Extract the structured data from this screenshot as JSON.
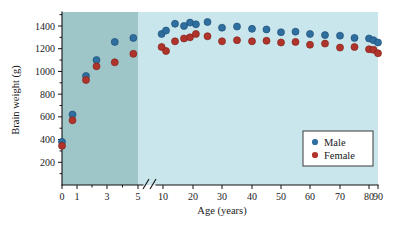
{
  "chart_data": {
    "type": "scatter",
    "title": "",
    "xlabel": "Age (years)",
    "ylabel": "Brain weight (g)",
    "xticks": [
      "0",
      "1",
      "3",
      "5",
      "10",
      "20",
      "30",
      "40",
      "50",
      "60",
      "70",
      "80",
      "90"
    ],
    "yticks": [
      "200",
      "400",
      "600",
      "800",
      "1000",
      "1200",
      "1400"
    ],
    "ylim": [
      0,
      1500
    ],
    "grid": false,
    "axis_break": {
      "between": [
        5,
        10
      ],
      "symbol": "//"
    },
    "legend": {
      "position": "bottom-right",
      "entries": [
        {
          "name": "Male",
          "color": "#2f6f9f"
        },
        {
          "name": "Female",
          "color": "#b0342c"
        }
      ]
    },
    "background_bands": [
      {
        "label": "early-childhood-band",
        "x_from": 0,
        "x_to": 5,
        "color": "#9ec6c8"
      },
      {
        "label": "adult-band",
        "x_from": 5,
        "x_to": 90,
        "color": "#c9e6ec"
      }
    ],
    "series": [
      {
        "name": "Male",
        "color": "#2f6f9f",
        "points": [
          {
            "x": 0,
            "y": 380
          },
          {
            "x": 0.7,
            "y": 620
          },
          {
            "x": 1.6,
            "y": 960
          },
          {
            "x": 2.3,
            "y": 1100
          },
          {
            "x": 3.5,
            "y": 1260
          },
          {
            "x": 4.7,
            "y": 1295
          },
          {
            "x": 9,
            "y": 1330
          },
          {
            "x": 11,
            "y": 1360
          },
          {
            "x": 14,
            "y": 1420
          },
          {
            "x": 17,
            "y": 1400
          },
          {
            "x": 19,
            "y": 1430
          },
          {
            "x": 21,
            "y": 1415
          },
          {
            "x": 25,
            "y": 1435
          },
          {
            "x": 30,
            "y": 1385
          },
          {
            "x": 35,
            "y": 1395
          },
          {
            "x": 40,
            "y": 1375
          },
          {
            "x": 45,
            "y": 1370
          },
          {
            "x": 50,
            "y": 1345
          },
          {
            "x": 55,
            "y": 1350
          },
          {
            "x": 60,
            "y": 1330
          },
          {
            "x": 65,
            "y": 1320
          },
          {
            "x": 70,
            "y": 1315
          },
          {
            "x": 75,
            "y": 1295
          },
          {
            "x": 80,
            "y": 1290
          },
          {
            "x": 85,
            "y": 1275
          },
          {
            "x": 90,
            "y": 1255
          }
        ]
      },
      {
        "name": "Female",
        "color": "#b0342c",
        "points": [
          {
            "x": 0,
            "y": 345
          },
          {
            "x": 0.7,
            "y": 570
          },
          {
            "x": 1.6,
            "y": 925
          },
          {
            "x": 2.3,
            "y": 1045
          },
          {
            "x": 3.5,
            "y": 1080
          },
          {
            "x": 4.7,
            "y": 1155
          },
          {
            "x": 9,
            "y": 1215
          },
          {
            "x": 11,
            "y": 1180
          },
          {
            "x": 14,
            "y": 1265
          },
          {
            "x": 17,
            "y": 1290
          },
          {
            "x": 19,
            "y": 1300
          },
          {
            "x": 21,
            "y": 1330
          },
          {
            "x": 25,
            "y": 1310
          },
          {
            "x": 30,
            "y": 1265
          },
          {
            "x": 35,
            "y": 1275
          },
          {
            "x": 40,
            "y": 1265
          },
          {
            "x": 45,
            "y": 1270
          },
          {
            "x": 50,
            "y": 1255
          },
          {
            "x": 55,
            "y": 1260
          },
          {
            "x": 60,
            "y": 1235
          },
          {
            "x": 65,
            "y": 1245
          },
          {
            "x": 70,
            "y": 1210
          },
          {
            "x": 75,
            "y": 1215
          },
          {
            "x": 80,
            "y": 1195
          },
          {
            "x": 85,
            "y": 1190
          },
          {
            "x": 90,
            "y": 1160
          }
        ]
      }
    ]
  }
}
